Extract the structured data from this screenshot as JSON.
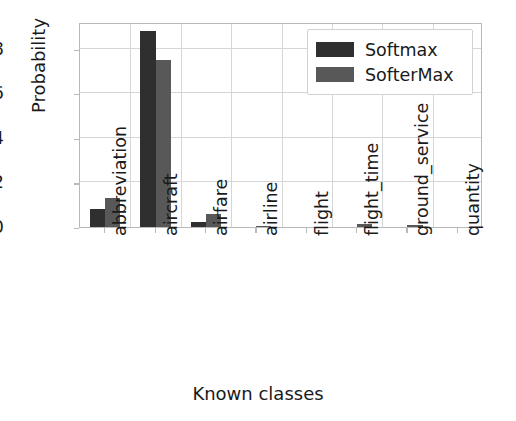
{
  "chart_data": {
    "type": "bar",
    "title": "",
    "xlabel": "Known classes",
    "ylabel": "Probability",
    "categories": [
      "abbreviation",
      "aircraft",
      "airfare",
      "airline",
      "flight",
      "flight_time",
      "ground_service",
      "quantity"
    ],
    "series": [
      {
        "name": "Softmax",
        "color": "#2f2f2f",
        "values": [
          0.08,
          0.88,
          0.022,
          0.0,
          0.0,
          0.0,
          0.0,
          0.0
        ]
      },
      {
        "name": "SofterMax",
        "color": "#585858",
        "values": [
          0.13,
          0.75,
          0.058,
          0.006,
          0.0,
          0.013,
          0.009,
          0.0
        ]
      }
    ],
    "ylim": [
      0.0,
      0.92
    ],
    "ytick_labels": [
      "0.0",
      "0.2",
      "0.4",
      "0.6",
      "0.8"
    ],
    "ytick_values": [
      0.0,
      0.2,
      0.4,
      0.6,
      0.8
    ],
    "grid": true,
    "legend_position": "upper right",
    "legend_entries": [
      "Softmax",
      "SofterMax"
    ]
  },
  "axes": {
    "ylabel": "Probability",
    "xlabel": "Known classes"
  }
}
